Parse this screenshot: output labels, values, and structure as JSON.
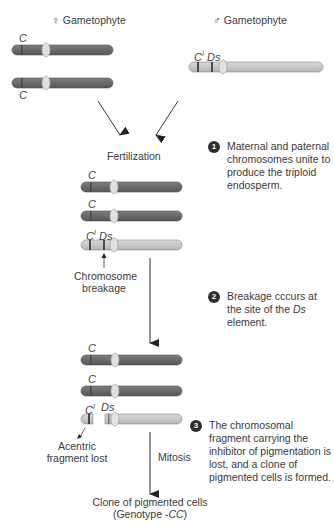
{
  "headers": {
    "female": {
      "symbol": "♀",
      "label": "Gametophyte"
    },
    "male": {
      "symbol": "♂",
      "label": "Gametophyte"
    }
  },
  "genes": {
    "C": "C",
    "CI_base": "C",
    "CI_sup": "I",
    "Ds": "Ds"
  },
  "labels": {
    "fertilization": "Fertilization",
    "breakage_line1": "Chromosome",
    "breakage_line2": "breakage",
    "acentric_line1": "Acentric",
    "acentric_line2": "fragment lost",
    "mitosis": "Mitosis",
    "clone_line1": "Clone of pigmented cells",
    "clone_line2_prefix": "(Genotype -",
    "clone_line2_genotype": "CC",
    "clone_line2_suffix": ")"
  },
  "steps": [
    {
      "number": "1",
      "text": "Maternal and paternal chromosomes unite to produce the triploid endosperm."
    },
    {
      "number": "2",
      "text_before": "Breakage cccurs at the site of the ",
      "text_italic": "Ds",
      "text_after": " element."
    },
    {
      "number": "3",
      "text": "The chromosomal fragment carrying the inhibitor of pigmentation is lost, and a clone of pigmented cells is formed."
    }
  ],
  "colors": {
    "dark_chromosome": "#6b6b6b",
    "light_chromosome": "#c9c9c9",
    "centromere": "#e2e2e2",
    "band": "#4a4a4a",
    "arrow": "#333333",
    "step_badge": "#2e2e2e"
  }
}
